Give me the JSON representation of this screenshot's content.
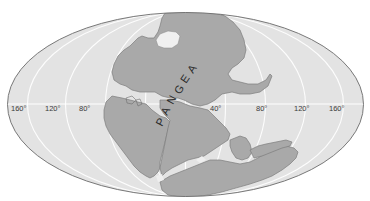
{
  "map": {
    "title": "PANGEA",
    "projection": "mollweide-style ellipse",
    "label": {
      "text": "PANGEA",
      "letters": [
        "P",
        "A",
        "N",
        "G",
        "E",
        "A"
      ]
    },
    "longitude_labels": {
      "west": [
        "160°",
        "120°",
        "80°"
      ],
      "east": [
        "40°",
        "80°",
        "120°",
        "160°"
      ]
    },
    "colors": {
      "ocean": "#e3e3e3",
      "land": "#a9a9a9",
      "land_outline": "#7d7d7d",
      "graticule": "#ffffff",
      "border": "#6a6a6a",
      "lake": "#f2f2f2",
      "text": "#333333"
    }
  }
}
